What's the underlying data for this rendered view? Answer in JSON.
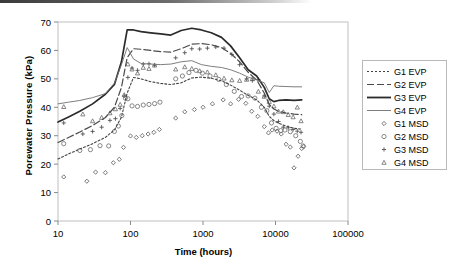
{
  "figure": {
    "scan_artifact": true
  },
  "chart_data": {
    "type": "scatter",
    "title": "",
    "xlabel": "Time (hours)",
    "ylabel": "Porewater Pressure (kPa)",
    "xscale": "log",
    "xlim": [
      10,
      100000
    ],
    "ylim": [
      0,
      70
    ],
    "xticks": [
      10,
      100,
      1000,
      10000,
      100000
    ],
    "xtick_labels": [
      "10",
      "100",
      "1000",
      "10000",
      "100000"
    ],
    "yticks": [
      0,
      10,
      20,
      30,
      40,
      50,
      60,
      70
    ],
    "ytick_labels": [
      "0",
      "10",
      "20",
      "30",
      "40",
      "50",
      "60",
      "70"
    ],
    "grid": false,
    "legend_position": "right-outside",
    "series": [
      {
        "name": "G1 EVP",
        "kind": "line",
        "style": "dotted",
        "color": "#444444",
        "points": [
          [
            10,
            21.8
          ],
          [
            14,
            23.6
          ],
          [
            20,
            25.3
          ],
          [
            30,
            27.2
          ],
          [
            45,
            29.4
          ],
          [
            60,
            32.0
          ],
          [
            75,
            36.5
          ],
          [
            90,
            45.0
          ],
          [
            110,
            50.5
          ],
          [
            140,
            50.0
          ],
          [
            190,
            49.0
          ],
          [
            260,
            48.4
          ],
          [
            360,
            48.0
          ],
          [
            500,
            48.6
          ],
          [
            700,
            50.3
          ],
          [
            950,
            50.6
          ],
          [
            1300,
            50.2
          ],
          [
            1800,
            49.3
          ],
          [
            2400,
            47.8
          ],
          [
            3200,
            46.0
          ],
          [
            4200,
            44.2
          ],
          [
            5500,
            42.6
          ],
          [
            7000,
            40.0
          ],
          [
            8200,
            36.8
          ],
          [
            9500,
            35.3
          ],
          [
            11000,
            34.4
          ],
          [
            14000,
            33.4
          ],
          [
            18000,
            32.6
          ],
          [
            23000,
            32.3
          ]
        ]
      },
      {
        "name": "G2 EVP",
        "kind": "line",
        "style": "dashed",
        "color": "#4a4a4a",
        "points": [
          [
            10,
            27.6
          ],
          [
            14,
            29.4
          ],
          [
            20,
            31.3
          ],
          [
            30,
            33.6
          ],
          [
            45,
            36.4
          ],
          [
            60,
            40.0
          ],
          [
            75,
            47.0
          ],
          [
            90,
            57.5
          ],
          [
            110,
            60.6
          ],
          [
            140,
            60.4
          ],
          [
            190,
            60.0
          ],
          [
            260,
            59.6
          ],
          [
            360,
            59.4
          ],
          [
            500,
            60.6
          ],
          [
            700,
            62.2
          ],
          [
            950,
            62.4
          ],
          [
            1300,
            62.0
          ],
          [
            1800,
            61.0
          ],
          [
            2400,
            59.0
          ],
          [
            3200,
            56.0
          ],
          [
            4200,
            52.3
          ],
          [
            5500,
            49.6
          ],
          [
            7000,
            45.0
          ],
          [
            8200,
            41.0
          ],
          [
            9500,
            39.4
          ],
          [
            11000,
            38.6
          ],
          [
            14000,
            38.0
          ],
          [
            18000,
            37.6
          ],
          [
            23000,
            37.4
          ]
        ]
      },
      {
        "name": "G3 EVP",
        "kind": "line",
        "style": "solid",
        "color": "#2b2b2b",
        "points": [
          [
            10,
            34.8
          ],
          [
            14,
            36.6
          ],
          [
            20,
            38.6
          ],
          [
            30,
            41.2
          ],
          [
            45,
            44.6
          ],
          [
            60,
            48.0
          ],
          [
            75,
            56.0
          ],
          [
            90,
            67.2
          ],
          [
            110,
            67.2
          ],
          [
            140,
            66.6
          ],
          [
            190,
            66.2
          ],
          [
            260,
            65.8
          ],
          [
            360,
            65.4
          ],
          [
            500,
            67.0
          ],
          [
            700,
            67.8
          ],
          [
            950,
            67.2
          ],
          [
            1300,
            66.2
          ],
          [
            1800,
            64.6
          ],
          [
            2400,
            61.6
          ],
          [
            3200,
            57.4
          ],
          [
            4200,
            53.2
          ],
          [
            5500,
            51.0
          ],
          [
            7000,
            47.0
          ],
          [
            8200,
            43.0
          ],
          [
            9500,
            42.0
          ],
          [
            11000,
            42.4
          ],
          [
            14000,
            42.6
          ],
          [
            18000,
            42.4
          ],
          [
            23000,
            42.6
          ]
        ]
      },
      {
        "name": "G4 EVP",
        "kind": "line",
        "style": "solid-thin",
        "color": "#6f6f6f",
        "points": [
          [
            10,
            41.2
          ],
          [
            14,
            41.8
          ],
          [
            20,
            42.4
          ],
          [
            30,
            43.4
          ],
          [
            45,
            44.8
          ],
          [
            60,
            48.5
          ],
          [
            75,
            55.0
          ],
          [
            90,
            61.0
          ],
          [
            110,
            57.0
          ],
          [
            140,
            55.4
          ],
          [
            190,
            55.2
          ],
          [
            260,
            55.0
          ],
          [
            360,
            55.2
          ],
          [
            500,
            56.0
          ],
          [
            700,
            56.4
          ],
          [
            950,
            55.0
          ],
          [
            1300,
            54.4
          ],
          [
            1800,
            54.0
          ],
          [
            2400,
            53.2
          ],
          [
            3200,
            52.0
          ],
          [
            4200,
            50.6
          ],
          [
            5500,
            49.6
          ],
          [
            7000,
            48.6
          ],
          [
            8200,
            45.2
          ],
          [
            9500,
            47.6
          ],
          [
            11000,
            47.4
          ],
          [
            14000,
            47.3
          ],
          [
            18000,
            47.2
          ],
          [
            23000,
            47.2
          ]
        ]
      },
      {
        "name": "G1 MSD",
        "kind": "scatter",
        "marker": "diamond",
        "color": "#555555",
        "points": [
          [
            12,
            15.5
          ],
          [
            25,
            14.0
          ],
          [
            33,
            17.2
          ],
          [
            45,
            17.0
          ],
          [
            58,
            20.5
          ],
          [
            70,
            21.7
          ],
          [
            80,
            25.9
          ],
          [
            100,
            29.9
          ],
          [
            120,
            29.4
          ],
          [
            145,
            30.0
          ],
          [
            175,
            30.6
          ],
          [
            210,
            31.2
          ],
          [
            250,
            32.2
          ],
          [
            420,
            36.2
          ],
          [
            560,
            38.4
          ],
          [
            760,
            39.2
          ],
          [
            1000,
            40.0
          ],
          [
            1350,
            41.2
          ],
          [
            1900,
            42.6
          ],
          [
            2400,
            41.2
          ],
          [
            3100,
            42.8
          ],
          [
            3900,
            41.4
          ],
          [
            4700,
            38.6
          ],
          [
            5700,
            36.8
          ],
          [
            7000,
            33.2
          ],
          [
            8000,
            31.0
          ],
          [
            9000,
            32.0
          ],
          [
            10500,
            31.6
          ],
          [
            12000,
            30.6
          ],
          [
            14000,
            27.0
          ],
          [
            16000,
            26.0
          ],
          [
            18000,
            18.7
          ],
          [
            20500,
            22.8
          ],
          [
            23000,
            25.5
          ],
          [
            24500,
            26.2
          ]
        ]
      },
      {
        "name": "G2 MSD",
        "kind": "scatter",
        "marker": "circle",
        "color": "#6a6a6a",
        "points": [
          [
            12,
            27.2
          ],
          [
            20,
            24.8
          ],
          [
            28,
            25.1
          ],
          [
            38,
            26.5
          ],
          [
            50,
            26.4
          ],
          [
            60,
            31.5
          ],
          [
            68,
            33.4
          ],
          [
            76,
            37.1
          ],
          [
            85,
            43.2
          ],
          [
            92,
            43.0
          ],
          [
            105,
            40.5
          ],
          [
            125,
            40.3
          ],
          [
            150,
            40.8
          ],
          [
            180,
            41.0
          ],
          [
            215,
            41.3
          ],
          [
            255,
            41.8
          ],
          [
            420,
            50.0
          ],
          [
            520,
            51.0
          ],
          [
            640,
            52.2
          ],
          [
            800,
            53.0
          ],
          [
            980,
            52.0
          ],
          [
            1250,
            51.0
          ],
          [
            1650,
            49.8
          ],
          [
            2100,
            48.0
          ],
          [
            2700,
            45.6
          ],
          [
            3400,
            43.8
          ],
          [
            4200,
            44.0
          ],
          [
            5200,
            43.2
          ],
          [
            6400,
            40.0
          ],
          [
            7600,
            38.8
          ],
          [
            8800,
            34.5
          ],
          [
            10200,
            32.6
          ],
          [
            11800,
            31.8
          ],
          [
            13500,
            32.0
          ],
          [
            16000,
            31.4
          ],
          [
            19000,
            30.0
          ],
          [
            22000,
            28.0
          ],
          [
            24000,
            26.4
          ]
        ]
      },
      {
        "name": "G3 MSD",
        "kind": "scatter",
        "marker": "plus",
        "color": "#555555",
        "points": [
          [
            12,
            34.5
          ],
          [
            22,
            30.6
          ],
          [
            30,
            31.5
          ],
          [
            40,
            33.0
          ],
          [
            52,
            35.4
          ],
          [
            62,
            36.0
          ],
          [
            72,
            39.6
          ],
          [
            82,
            44.0
          ],
          [
            92,
            50.5
          ],
          [
            105,
            53.8
          ],
          [
            125,
            53.0
          ],
          [
            150,
            55.2
          ],
          [
            180,
            55.3
          ],
          [
            215,
            54.8
          ],
          [
            420,
            57.4
          ],
          [
            560,
            59.2
          ],
          [
            700,
            60.6
          ],
          [
            900,
            60.5
          ],
          [
            1150,
            60.8
          ],
          [
            1500,
            61.2
          ],
          [
            1950,
            60.8
          ],
          [
            2500,
            58.6
          ],
          [
            3200,
            55.0
          ],
          [
            4000,
            50.0
          ],
          [
            4800,
            49.4
          ],
          [
            5800,
            49.8
          ],
          [
            7000,
            44.0
          ],
          [
            8200,
            40.4
          ],
          [
            9500,
            37.6
          ],
          [
            11000,
            35.0
          ],
          [
            12800,
            33.0
          ],
          [
            15000,
            32.8
          ],
          [
            17500,
            32.2
          ],
          [
            20000,
            31.6
          ],
          [
            22500,
            31.2
          ]
        ]
      },
      {
        "name": "G4 MSD",
        "kind": "scatter",
        "marker": "triangle",
        "color": "#6a6a6a",
        "points": [
          [
            12,
            40.2
          ],
          [
            22,
            37.6
          ],
          [
            30,
            35.2
          ],
          [
            40,
            36.4
          ],
          [
            52,
            38.0
          ],
          [
            62,
            39.4
          ],
          [
            72,
            41.0
          ],
          [
            82,
            44.4
          ],
          [
            92,
            55.2
          ],
          [
            105,
            53.4
          ],
          [
            125,
            52.0
          ],
          [
            150,
            54.0
          ],
          [
            180,
            53.6
          ],
          [
            215,
            54.8
          ],
          [
            420,
            53.4
          ],
          [
            560,
            54.2
          ],
          [
            700,
            53.6
          ],
          [
            900,
            52.8
          ],
          [
            1150,
            52.4
          ],
          [
            1500,
            51.4
          ],
          [
            1950,
            50.2
          ],
          [
            2500,
            49.6
          ],
          [
            3200,
            49.4
          ],
          [
            4000,
            49.8
          ],
          [
            4800,
            50.0
          ],
          [
            5800,
            45.6
          ],
          [
            7000,
            43.8
          ],
          [
            8200,
            42.0
          ],
          [
            9500,
            40.4
          ],
          [
            11000,
            38.6
          ],
          [
            12800,
            38.4
          ],
          [
            15000,
            37.4
          ],
          [
            17500,
            36.6
          ],
          [
            20000,
            40.0
          ],
          [
            22500,
            35.2
          ]
        ]
      }
    ]
  },
  "legend": {
    "entries": [
      {
        "label": "G1 EVP",
        "key": "dotted-line"
      },
      {
        "label": "G2 EVP",
        "key": "dashed-line"
      },
      {
        "label": "G3 EVP",
        "key": "solid-line-thick"
      },
      {
        "label": "G4 EVP",
        "key": "solid-line-thin"
      },
      {
        "label": "G1 MSD",
        "key": "diamond-marker"
      },
      {
        "label": "G2 MSD",
        "key": "circle-marker"
      },
      {
        "label": "G3 MSD",
        "key": "plus-marker"
      },
      {
        "label": "G4 MSD",
        "key": "triangle-marker"
      }
    ]
  }
}
